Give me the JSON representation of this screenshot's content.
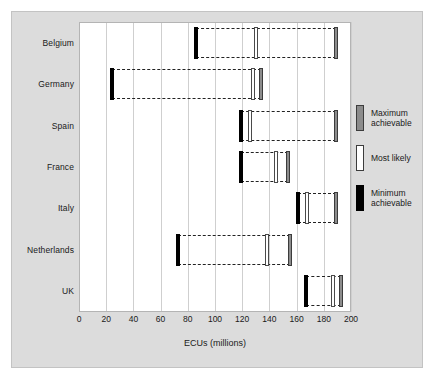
{
  "chart_data": {
    "type": "bar",
    "title": "",
    "xlabel": "ECUs (millions)",
    "ylabel": "",
    "xlim": [
      0,
      200
    ],
    "xticks": [
      0,
      20,
      40,
      60,
      80,
      100,
      120,
      140,
      160,
      180,
      200
    ],
    "grid": true,
    "legend_position": "right",
    "categories": [
      "Belgium",
      "Germany",
      "Spain",
      "France",
      "Italy",
      "Netherlands",
      "UK"
    ],
    "series": [
      {
        "name": "Minimum achievable",
        "values": [
          86,
          24,
          119,
          119,
          161,
          73,
          167
        ]
      },
      {
        "name": "Most likely",
        "values": [
          130,
          128,
          126,
          145,
          168,
          138,
          187
        ]
      },
      {
        "name": "Maximum achievable",
        "values": [
          189,
          134,
          189,
          154,
          189,
          155,
          193
        ]
      }
    ],
    "colors": {
      "minimum": "#000000",
      "most_likely": "#ffffff",
      "maximum": "#8c8c8c",
      "panel_background": "#dcdcdc",
      "plot_background": "#ffffff",
      "gridline": "#cfcfcf",
      "range_outline": "#222222"
    }
  },
  "axis": {
    "x_title": "ECUs (millions)",
    "x_tick_labels": [
      "0",
      "20",
      "40",
      "60",
      "80",
      "100",
      "120",
      "140",
      "160",
      "180",
      "200"
    ],
    "y_tick_labels": [
      "Belgium",
      "Germany",
      "Spain",
      "France",
      "Italy",
      "Netherlands",
      "UK"
    ]
  },
  "legend": {
    "items": [
      {
        "key": "max",
        "label": "Maximum\nachievable"
      },
      {
        "key": "likely",
        "label": "Most likely"
      },
      {
        "key": "min",
        "label": "Minimum\nachievable"
      }
    ]
  }
}
